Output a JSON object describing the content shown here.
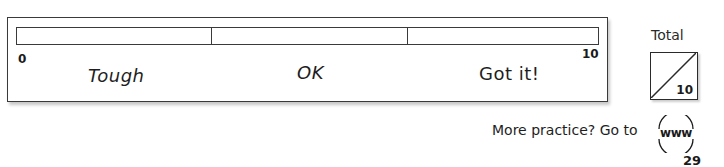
{
  "self_assessment": {
    "scale": {
      "min_label": "0",
      "max_label": "10",
      "ratings": [
        "Tough",
        "OK",
        "Got it!"
      ]
    },
    "total": {
      "label": "Total",
      "score": "",
      "max": "10"
    }
  },
  "footer": {
    "practice_text": "More practice?  Go to",
    "www_icon_text": "www",
    "page_number": "29"
  }
}
